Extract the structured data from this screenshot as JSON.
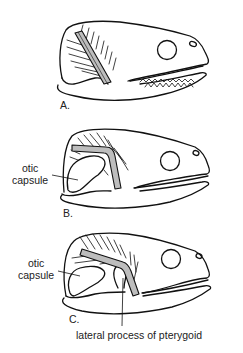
{
  "figure": {
    "panels": [
      {
        "id": "A",
        "label": "A."
      },
      {
        "id": "B",
        "label": "B.",
        "annotation": "otic capsule"
      },
      {
        "id": "C",
        "label": "C.",
        "annotation": "otic capsule"
      }
    ],
    "labels": {
      "otic_capsule_line1": "otic",
      "otic_capsule_line2": "capsule",
      "lateral_process": "lateral process of pterygoid"
    }
  }
}
